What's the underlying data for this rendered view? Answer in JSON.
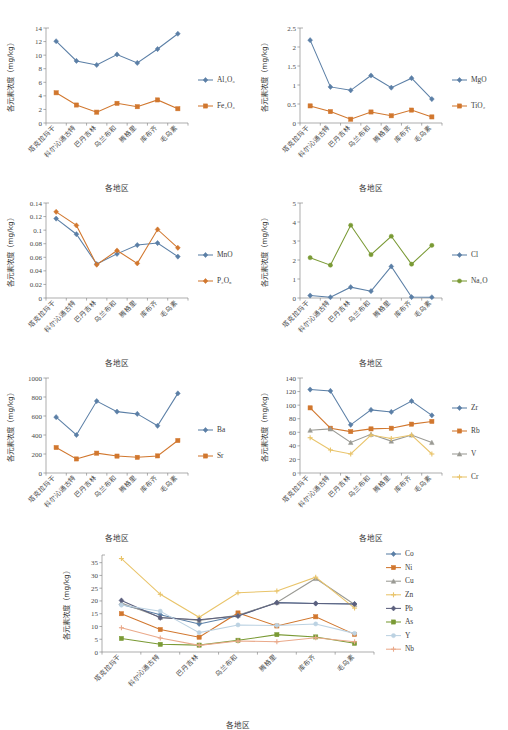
{
  "figure": {
    "shared": {
      "ylabel": "各元素浓度（mg/kg）",
      "xlabel": "各地区",
      "categories": [
        "塔克拉玛干",
        "科尔沁通古特",
        "巴丹吉林",
        "乌兰布和",
        "腾格里",
        "库布齐",
        "毛乌素"
      ]
    },
    "colors": {
      "blue": "#5b7fa6",
      "orange": "#d1772e",
      "gray": "#9a9a94",
      "yellow": "#e9c46a",
      "navy": "#5b5f7d",
      "green": "#7a9a35",
      "lightblue": "#bcd2e2",
      "salmon": "#eaa98a",
      "olive": "#8aa33c"
    }
  },
  "chart_data": [
    {
      "id": "panel-1",
      "type": "line",
      "title": "",
      "xlabel": "各地区",
      "ylabel": "各元素浓度（mg/kg）",
      "categories": [
        "塔克拉玛干",
        "科尔沁通古特",
        "巴丹吉林",
        "乌兰布和",
        "腾格里",
        "库布齐",
        "毛乌素"
      ],
      "ylim": [
        0,
        14
      ],
      "yticks": [
        0,
        2,
        4,
        6,
        8,
        10,
        12,
        14
      ],
      "grid": false,
      "legend_position": "right",
      "series": [
        {
          "name": "Al₂O₃",
          "color": "#5b7fa6",
          "marker": "diamond",
          "values": [
            12.05,
            9.15,
            8.55,
            10.1,
            8.85,
            10.9,
            13.15
          ]
        },
        {
          "name": "Fe₂O₃",
          "color": "#d1772e",
          "marker": "square",
          "values": [
            4.45,
            2.65,
            1.6,
            2.9,
            2.4,
            3.4,
            2.1
          ]
        }
      ]
    },
    {
      "id": "panel-2",
      "type": "line",
      "title": "",
      "xlabel": "各地区",
      "ylabel": "各元素浓度（mg/kg）",
      "categories": [
        "塔克拉玛干",
        "科尔沁通古特",
        "巴丹吉林",
        "乌兰布和",
        "腾格里",
        "库布齐",
        "毛乌素"
      ],
      "ylim": [
        0,
        2.5
      ],
      "yticks": [
        0,
        0.5,
        1,
        1.5,
        2,
        2.5
      ],
      "grid": false,
      "legend_position": "right",
      "series": [
        {
          "name": "MgO",
          "color": "#5b7fa6",
          "marker": "diamond",
          "values": [
            2.18,
            0.95,
            0.86,
            1.25,
            0.93,
            1.18,
            0.63
          ]
        },
        {
          "name": "TiO₂",
          "color": "#d1772e",
          "marker": "square",
          "values": [
            0.45,
            0.3,
            0.1,
            0.29,
            0.19,
            0.34,
            0.16
          ]
        }
      ]
    },
    {
      "id": "panel-3",
      "type": "line",
      "title": "",
      "xlabel": "各地区",
      "ylabel": "各元素浓度（mg/kg）",
      "categories": [
        "塔克拉玛干",
        "科尔沁通古特",
        "巴丹吉林",
        "乌兰布和",
        "腾格里",
        "库布齐",
        "毛乌素"
      ],
      "ylim": [
        0,
        0.14
      ],
      "yticks": [
        0,
        0.02,
        0.04,
        0.06,
        0.08,
        0.1,
        0.12,
        0.14
      ],
      "grid": false,
      "legend_position": "right",
      "series": [
        {
          "name": "MnO",
          "color": "#5b7fa6",
          "marker": "diamond",
          "values": [
            0.117,
            0.094,
            0.05,
            0.065,
            0.078,
            0.081,
            0.061
          ]
        },
        {
          "name": "P₂O₅",
          "color": "#d1772e",
          "marker": "diamond",
          "values": [
            0.127,
            0.107,
            0.049,
            0.07,
            0.051,
            0.101,
            0.074
          ]
        }
      ]
    },
    {
      "id": "panel-4",
      "type": "line",
      "title": "",
      "xlabel": "各地区",
      "ylabel": "各元素浓度（mg/kg）",
      "categories": [
        "塔克拉玛干",
        "科尔沁通古特",
        "巴丹吉林",
        "乌兰布和",
        "腾格里",
        "库布齐",
        "毛乌素"
      ],
      "ylim": [
        0,
        5
      ],
      "yticks": [
        0,
        1,
        2,
        3,
        4,
        5
      ],
      "grid": false,
      "legend_position": "right",
      "series": [
        {
          "name": "Cl",
          "color": "#5b7fa6",
          "marker": "diamond",
          "values": [
            0.13,
            0.04,
            0.57,
            0.36,
            1.66,
            0.05,
            0.04
          ]
        },
        {
          "name": "Na₂O",
          "color": "#7a9a35",
          "marker": "circle",
          "values": [
            2.12,
            1.73,
            3.83,
            2.28,
            3.25,
            1.78,
            2.77
          ]
        }
      ]
    },
    {
      "id": "panel-5",
      "type": "line",
      "title": "",
      "xlabel": "各地区",
      "ylabel": "各元素浓度（mg/kg）",
      "categories": [
        "塔克拉玛干",
        "科尔沁通古特",
        "巴丹吉林",
        "乌兰布和",
        "腾格里",
        "库布齐",
        "毛乌素"
      ],
      "ylim": [
        0,
        1000
      ],
      "yticks": [
        0,
        200,
        400,
        600,
        800,
        1000
      ],
      "grid": false,
      "legend_position": "right",
      "series": [
        {
          "name": "Ba",
          "color": "#5b7fa6",
          "marker": "diamond",
          "values": [
            588,
            400,
            757,
            646,
            622,
            497,
            838
          ]
        },
        {
          "name": "Sr",
          "color": "#d1772e",
          "marker": "square",
          "values": [
            268,
            148,
            209,
            178,
            165,
            180,
            342
          ]
        }
      ]
    },
    {
      "id": "panel-6",
      "type": "line",
      "title": "",
      "xlabel": "各地区",
      "ylabel": "各元素浓度（mg/kg）",
      "categories": [
        "塔克拉玛干",
        "科尔沁通古特",
        "巴丹吉林",
        "乌兰布和",
        "腾格里",
        "库布齐",
        "毛乌素"
      ],
      "ylim": [
        0,
        140
      ],
      "yticks": [
        0,
        20,
        40,
        60,
        80,
        100,
        120,
        140
      ],
      "grid": false,
      "legend_position": "right",
      "series": [
        {
          "name": "Zr",
          "color": "#5b7fa6",
          "marker": "diamond",
          "values": [
            123,
            121,
            71,
            93,
            90,
            106,
            85
          ]
        },
        {
          "name": "Rb",
          "color": "#d1772e",
          "marker": "square",
          "values": [
            96,
            66,
            61,
            65,
            66,
            72,
            76
          ]
        },
        {
          "name": "V",
          "color": "#9a9a94",
          "marker": "triangle",
          "values": [
            63,
            65,
            45,
            57,
            47,
            56,
            45
          ]
        },
        {
          "name": "Cr",
          "color": "#e9c46a",
          "marker": "cross",
          "values": [
            52,
            34,
            28,
            56,
            51,
            56,
            28
          ]
        }
      ]
    },
    {
      "id": "panel-7",
      "type": "line",
      "title": "",
      "xlabel": "各地区",
      "ylabel": "各元素浓度（mg/kg）",
      "categories": [
        "塔克拉玛干",
        "科尔沁通古特",
        "巴丹吉林",
        "乌兰布和",
        "腾格里",
        "库布齐",
        "毛乌素"
      ],
      "ylim": [
        0,
        38
      ],
      "yticks": [
        0,
        5,
        10,
        15,
        20,
        25,
        30,
        35
      ],
      "grid": false,
      "legend_position": "right",
      "series": [
        {
          "name": "Co",
          "color": "#5b7fa6",
          "marker": "diamond",
          "values": [
            18.6,
            14.6,
            11.0,
            14.2,
            19.4,
            19.0,
            18.8
          ]
        },
        {
          "name": "Ni",
          "color": "#d1772e",
          "marker": "square",
          "values": [
            15.0,
            8.8,
            5.8,
            15.3,
            10.2,
            13.8,
            6.9
          ]
        },
        {
          "name": "Cu",
          "color": "#9a9a94",
          "marker": "triangle",
          "values": [
            19.2,
            13.6,
            12.4,
            14.4,
            19.4,
            28.8,
            18.6
          ]
        },
        {
          "name": "Zn",
          "color": "#e9c46a",
          "marker": "cross",
          "values": [
            36.6,
            22.6,
            13.6,
            23.2,
            23.9,
            29.3,
            17.2
          ]
        },
        {
          "name": "Pb",
          "color": "#5b5f7d",
          "marker": "diamond",
          "values": [
            20.2,
            13.4,
            12.6,
            14.1,
            19.3,
            19.0,
            18.8
          ]
        },
        {
          "name": "As",
          "color": "#7a9a35",
          "marker": "square",
          "values": [
            5.3,
            3.0,
            2.7,
            4.6,
            6.8,
            5.9,
            3.4
          ]
        },
        {
          "name": "Y",
          "color": "#bcd2e2",
          "marker": "circle",
          "values": [
            18.4,
            16.0,
            7.6,
            10.6,
            10.4,
            11.0,
            7.3
          ]
        },
        {
          "name": "Nb",
          "color": "#eaa98a",
          "marker": "cross",
          "values": [
            9.5,
            5.5,
            2.6,
            4.3,
            4.0,
            5.6,
            4.0
          ]
        }
      ]
    }
  ]
}
